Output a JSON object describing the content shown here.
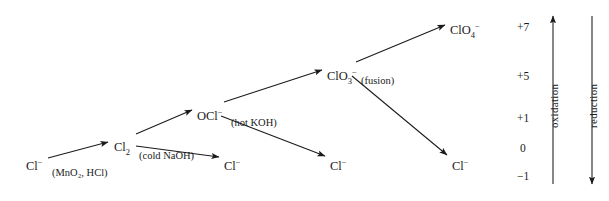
{
  "diagram": {
    "nodes": [
      {
        "id": "cl-start",
        "html": "Cl<sup>−</sup>",
        "x": 26,
        "y": 158
      },
      {
        "id": "cl2",
        "html": "Cl<sub>2</sub>",
        "x": 114,
        "y": 141
      },
      {
        "id": "ocl",
        "html": "OCl<sup>−</sup>",
        "x": 197,
        "y": 108
      },
      {
        "id": "clo3",
        "html": "ClO<sub>3</sub><sup>−</sup>",
        "x": 327,
        "y": 68
      },
      {
        "id": "clo4",
        "html": "ClO<sub>4</sub><sup>−</sup>",
        "x": 450,
        "y": 22
      },
      {
        "id": "cl-mid1",
        "html": "Cl<sup>−</sup>",
        "x": 224,
        "y": 158
      },
      {
        "id": "cl-mid2",
        "html": "Cl<sup>−</sup>",
        "x": 330,
        "y": 158
      },
      {
        "id": "cl-mid3",
        "html": "Cl<sup>−</sup>",
        "x": 452,
        "y": 158
      }
    ],
    "conditions": [
      {
        "id": "cond-mno2-hcl",
        "text": "(MnO₂, HCl)",
        "x": 52,
        "y": 168
      },
      {
        "id": "cond-cold-naoh",
        "text": "(cold NaOH)",
        "x": 139,
        "y": 151
      },
      {
        "id": "cond-hot-koh",
        "text": "(hot KOH)",
        "x": 231,
        "y": 118
      },
      {
        "id": "cond-fusion",
        "text": "(fusion)",
        "x": 361,
        "y": 76
      }
    ],
    "oxidation_numbers": [
      {
        "value": "+7",
        "x": 517,
        "y": 22
      },
      {
        "value": "+5",
        "x": 517,
        "y": 71
      },
      {
        "value": "+1",
        "x": 517,
        "y": 113
      },
      {
        "value": "0",
        "x": 517,
        "y": 143
      },
      {
        "value": "−1",
        "x": 517,
        "y": 171
      }
    ],
    "axes": [
      {
        "id": "oxidation-axis",
        "label": "oxidation",
        "direction": "up"
      },
      {
        "id": "reduction-axis",
        "label": "reduction",
        "direction": "down"
      }
    ],
    "colors": {
      "ink": "#1a1a1a",
      "background": "#ffffff"
    }
  }
}
